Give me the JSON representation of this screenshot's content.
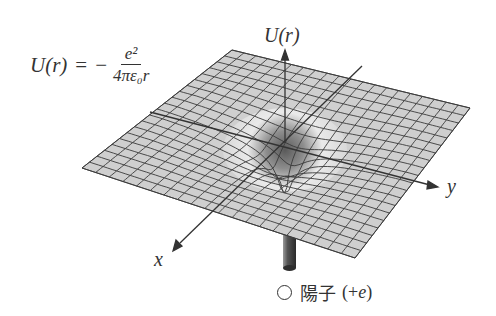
{
  "figure": {
    "formula": {
      "lhs": "U(r)",
      "equals": "=",
      "sign": "−",
      "numerator": "e²",
      "denominator": "4πε₀r"
    },
    "axes": {
      "vertical_label": "U(r)",
      "y_label": "y",
      "x_label": "x"
    },
    "proton": {
      "marker": "circle",
      "text": "陽子",
      "charge_open": "(+",
      "charge_symbol": "e",
      "charge_close": ")"
    },
    "colors": {
      "surface": "#cfcfcf",
      "grid_line": "#3a3a3a",
      "axis": "#333333",
      "text": "#333333",
      "background": "#ffffff"
    },
    "grid": {
      "divisions": 20
    }
  }
}
